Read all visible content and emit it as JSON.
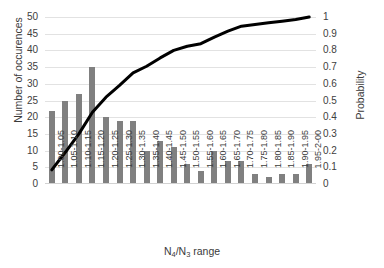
{
  "chart_data": {
    "type": "bar",
    "title": "",
    "subtitle": "",
    "xlabel": "N4/N3 range",
    "xlabel_parts": {
      "pre": "N",
      "sub1": "4",
      "mid": "/N",
      "sub2": "3",
      "post": " range"
    },
    "ylabel": "Number of occurences",
    "ylabel_secondary": "Probability",
    "ylim": [
      0,
      50
    ],
    "ylim_secondary": [
      0,
      1
    ],
    "yticks": [
      0,
      5,
      10,
      15,
      20,
      25,
      30,
      35,
      40,
      45,
      50
    ],
    "yticks_secondary": [
      "0",
      "0.1",
      "0.2",
      "0.3",
      "0.4",
      "0.5",
      "0.6",
      "0.7",
      "0.8",
      "0.9",
      "1"
    ],
    "grid": true,
    "legend": "none",
    "categories": [
      "1.00-1.05",
      "1.05-1.10",
      "1.10-1.15",
      "1.15-1.20",
      "1.20-1.25",
      "1.25-1.30",
      "1.30-1.35",
      "1.35-1.40",
      "1.40-1.45",
      "1.45-1.50",
      "1.50-1.55",
      "1.55-1.60",
      "1.60-1.65",
      "1.65-1.70",
      "1.70-1.75",
      "1.75-1.80",
      "1.80-1.85",
      "1.85-1.90",
      "1.90-1.95",
      "1.95-2-00"
    ],
    "series": [
      {
        "name": "Number of occurences",
        "type": "bar",
        "axis": "left",
        "color": "#808080",
        "values": [
          22,
          25,
          27,
          35,
          20,
          19,
          19,
          10,
          13,
          11,
          6,
          4,
          10,
          7,
          7,
          3,
          2,
          3,
          3,
          6
        ]
      },
      {
        "name": "Probability",
        "type": "line",
        "axis": "right",
        "color": "#000000",
        "values": [
          0.085,
          0.19,
          0.3,
          0.43,
          0.52,
          0.59,
          0.665,
          0.705,
          0.755,
          0.8,
          0.825,
          0.84,
          0.88,
          0.915,
          0.945,
          0.955,
          0.965,
          0.975,
          0.985,
          1.0
        ]
      }
    ]
  }
}
